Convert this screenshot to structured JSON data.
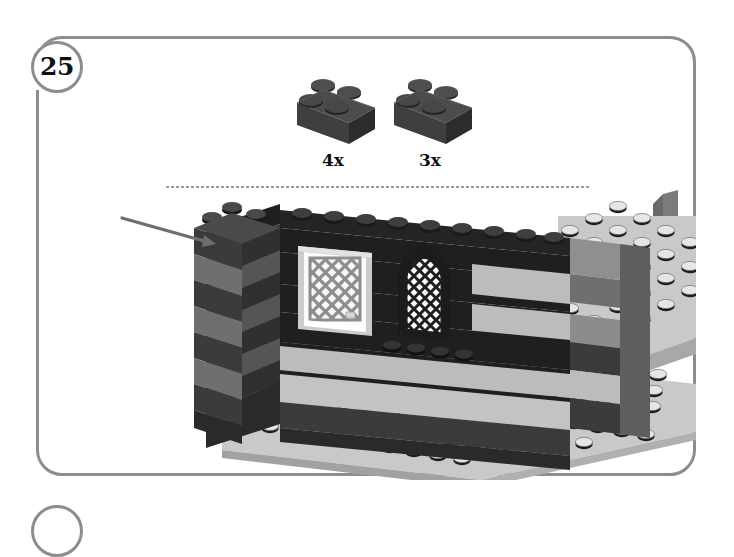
{
  "page": {
    "kind": "lego-building-instruction-step",
    "background_color": "#ffffff",
    "width": 734,
    "height": 519
  },
  "step_frame": {
    "border_color": "#8d8d8d",
    "border_width_px": 3,
    "corner_radius_px": 26
  },
  "step": {
    "number": "25",
    "circle_border_color": "#8d8d8d"
  },
  "next_step": {
    "label": "",
    "partially_visible": true
  },
  "parts_callout": {
    "items": [
      {
        "name": "brick-2x2",
        "quantity_label": "4x",
        "color_name": "dark-gray",
        "color_hex": "#3c3c3c",
        "top_color_hex": "#4a4a4a",
        "side_color_hex": "#2e2e2e",
        "stud_color_hex": "#333333"
      },
      {
        "name": "brick-2x2",
        "quantity_label": "3x",
        "color_name": "dark-gray",
        "color_hex": "#3c3c3c",
        "top_color_hex": "#4a4a4a",
        "side_color_hex": "#2e2e2e",
        "stud_color_hex": "#333333"
      }
    ]
  },
  "alignment_guide": {
    "style": "dotted",
    "color_hex": "#9a9a9a",
    "orientation": "horizontal"
  },
  "leader_line": {
    "color_hex": "#6e6e6e",
    "has_arrow_head": true,
    "points_to": "corner-column-2x2-brick"
  },
  "model": {
    "description": "Tudor-style half-timbered wall on light gray baseplates",
    "colors": {
      "black": "#1f1f1f",
      "dark_gray": "#3b3b3b",
      "medium_gray": "#6f6f6f",
      "light_gray": "#b9b9b9",
      "very_light_gray": "#d3d3d3",
      "white_pane": "#fbfbfb",
      "baseplate": "#c9c9c9",
      "baseplate_edge": "#9e9e9e",
      "stud_top": "#e3e3e3",
      "stud_shadow": "#1c1c1c"
    },
    "elements": [
      {
        "name": "corner-column",
        "color": "dark_gray"
      },
      {
        "name": "wall-stripes",
        "pattern": "alternating dark and light horizontal bands"
      },
      {
        "name": "square-window",
        "frame_color": "light_gray",
        "pane": "lattice-diamond"
      },
      {
        "name": "arched-window",
        "frame_color": "black",
        "pane": "lattice-diamond"
      },
      {
        "name": "baseplate-left",
        "color": "baseplate"
      },
      {
        "name": "baseplate-right",
        "color": "baseplate"
      },
      {
        "name": "right-edge-column",
        "color": "medium_gray"
      }
    ]
  }
}
